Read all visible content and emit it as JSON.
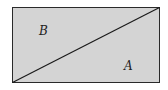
{
  "diagram": {
    "shape": "rectangle divided by diagonal",
    "fill_color": "#d4d4d4",
    "stroke_color": "#2a2a2a",
    "regions": [
      {
        "label": "B",
        "position": "upper-left triangle"
      },
      {
        "label": "A",
        "position": "lower-right triangle"
      }
    ]
  }
}
